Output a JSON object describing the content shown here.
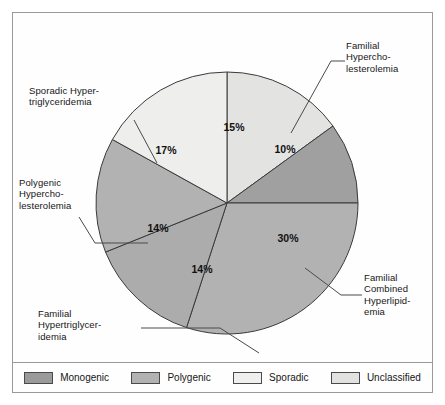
{
  "chart_data": {
    "type": "pie",
    "title": "",
    "subtitle": "",
    "xlabel": "",
    "ylabel": "",
    "grid": false,
    "legend_position": "bottom",
    "units": "percent",
    "total": 100,
    "start_angle_deg": 0,
    "direction": "clockwise",
    "categories": [
      "Unclassified",
      "Familial Hypercholesterolemia",
      "Familial Combined Hyperlipidemia",
      "Familial Hypertriglyceridemia",
      "Polygenic Hypercholesterolemia",
      "Sporadic Hypertriglyceridemia"
    ],
    "values": [
      15,
      10,
      30,
      14,
      14,
      17
    ],
    "slices": [
      {
        "id": "unclassified",
        "label_text": "",
        "value": 15,
        "value_label": "15%",
        "group": "Unclassified",
        "color": "#e3e3e1",
        "start_deg": 0,
        "end_deg": 54,
        "pct_x": 234,
        "pct_y": 131
      },
      {
        "id": "familial-hypercholesterolemia",
        "label_text": "Familial\nHypercho-\nlesterolemia",
        "value": 10,
        "value_label": "10%",
        "group": "Monogenic",
        "color": "#a0a0a0",
        "start_deg": 54,
        "end_deg": 90,
        "pct_x": 285,
        "pct_y": 153
      },
      {
        "id": "familial-combined-hyperlipidemia",
        "label_text": "Familial\nCombined\nHyperlipid-\nemia",
        "value": 30,
        "value_label": "30%",
        "group": "Polygenic",
        "color": "#b2b2b2",
        "start_deg": 90,
        "end_deg": 198,
        "pct_x": 288,
        "pct_y": 242
      },
      {
        "id": "familial-hypertriglyceridemia",
        "label_text": "Familial\nHypertriglycer-\nidemia",
        "value": 14,
        "value_label": "14%",
        "group": "Monogenic",
        "color": "#acacac",
        "start_deg": 198,
        "end_deg": 248,
        "pct_x": 202,
        "pct_y": 273
      },
      {
        "id": "polygenic-hypercholesterolemia",
        "label_text": "Polygenic\nHypercho-\nlesterolemia",
        "value": 14,
        "value_label": "14%",
        "group": "Polygenic",
        "color": "#b2b2b2",
        "start_deg": 248,
        "end_deg": 299,
        "pct_x": 158,
        "pct_y": 232
      },
      {
        "id": "sporadic-hypertriglyceridemia",
        "label_text": "Sporadic Hyper-\ntriglyceridemia",
        "value": 17,
        "value_label": "17%",
        "group": "Sporadic",
        "color": "#eeeeec",
        "start_deg": 299,
        "end_deg": 360,
        "pct_x": 166,
        "pct_y": 154
      }
    ],
    "legend": [
      {
        "label": "Monogenic",
        "color": "#9a9a9a"
      },
      {
        "label": "Polygenic",
        "color": "#b2b2b2"
      },
      {
        "label": "Sporadic",
        "color": "#efefed"
      },
      {
        "label": "Unclassified",
        "color": "#e2e2e0"
      }
    ],
    "annotations": [
      {
        "id": "familial-hypercholesterolemia",
        "text": "Familial\nHypercho-\nlesterolemia"
      },
      {
        "id": "sporadic-hypertriglyceridemia",
        "text": "Sporadic Hyper-\ntriglyceridemia"
      },
      {
        "id": "polygenic-hypercholesterolemia",
        "text": "Polygenic\nHypercho-\nlesterolemia"
      },
      {
        "id": "familial-hypertriglyceridemia",
        "text": "Familial\nHypertriglycer-\nidemia"
      },
      {
        "id": "familial-combined-hyperlipidemia",
        "text": "Familial\nCombined\nHyperlipid-\nemia"
      }
    ]
  },
  "geometry": {
    "center_x": 227,
    "center_y": 203,
    "radius": 131
  },
  "colors": {
    "monogenic": "#9a9a9a",
    "polygenic": "#b2b2b2",
    "sporadic": "#efefed",
    "unclassified": "#e2e2e0",
    "outline": "#3a3a3a",
    "frame": "#9a9a9a",
    "text": "#161616"
  }
}
